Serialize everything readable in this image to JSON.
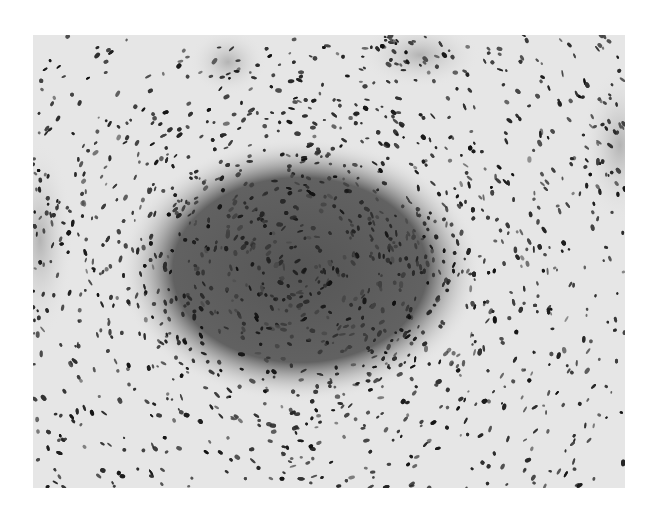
{
  "image": {
    "kind": "histology-micrograph",
    "color_mode": "grayscale",
    "background_color": "#ffffff",
    "field_color": "#e6e6e6",
    "nucleus_color": "#1a1a1a",
    "frame": {
      "x": 33,
      "y": 35,
      "width": 592,
      "height": 453
    },
    "regions": [
      {
        "name": "central-nodule",
        "cx": 300,
        "cy": 270,
        "rx": 165,
        "ry": 120,
        "density": 1.0,
        "shade": "#3a3a3a"
      },
      {
        "name": "top-whorl",
        "cx": 228,
        "cy": 62,
        "rx": 35,
        "ry": 30,
        "density": 0.7,
        "shade": "#9a9a9a"
      },
      {
        "name": "top-right-cluster",
        "cx": 420,
        "cy": 55,
        "rx": 55,
        "ry": 30,
        "density": 0.75,
        "shade": "#8a8a8a"
      },
      {
        "name": "right-edge-cluster",
        "cx": 620,
        "cy": 145,
        "rx": 35,
        "ry": 70,
        "density": 0.8,
        "shade": "#7a7a7a"
      },
      {
        "name": "left-edge-cluster",
        "cx": 40,
        "cy": 240,
        "rx": 30,
        "ry": 90,
        "density": 0.8,
        "shade": "#7a7a7a"
      }
    ]
  }
}
